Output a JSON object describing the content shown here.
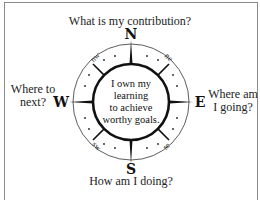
{
  "diagram": {
    "center_text": [
      "I own my",
      "learning",
      "to achieve",
      "worthy goals."
    ],
    "questions": {
      "north": "What is my contribution?",
      "west": [
        "Where to",
        "next?"
      ],
      "east": [
        "Where am",
        "I going?"
      ],
      "south": "How am I doing?"
    },
    "cardinal": {
      "n": "N",
      "e": "E",
      "s": "S",
      "w": "W"
    },
    "intercardinal": {
      "nw": "nw",
      "ne": "ne",
      "sw": "sw",
      "se": "se"
    },
    "colors": {
      "ink": "#1a1a1a",
      "frame": "#8a8a8a",
      "background": "#ffffff"
    }
  }
}
